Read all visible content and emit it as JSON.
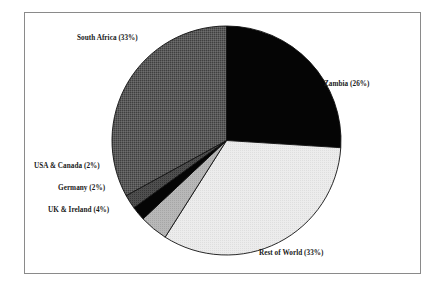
{
  "chart_data": {
    "type": "pie",
    "title": "",
    "subtitle": "",
    "xlabel": "",
    "ylabel": "",
    "legend_position": "none",
    "grid": false,
    "labels_show_percent": true,
    "start_angle_deg": 0,
    "direction": "clockwise",
    "categories": [
      "Zambia",
      "Rest of World",
      "UK & Ireland",
      "Germany",
      "USA & Canada",
      "South Africa"
    ],
    "values": [
      26,
      33,
      4,
      2,
      2,
      33
    ],
    "slices": [
      {
        "name": "Zambia",
        "label": "Zambia (26%)",
        "value": 26,
        "color": "#050505",
        "start_deg": 0,
        "end_deg": 93.6
      },
      {
        "name": "Rest of World",
        "label": "Rest of World (33%)",
        "value": 33,
        "color": "#e6e6e6",
        "start_deg": 93.6,
        "end_deg": 212.4
      },
      {
        "name": "UK & Ireland",
        "label": "UK & Ireland (4%)",
        "value": 4,
        "color": "#b4b4b4",
        "start_deg": 212.4,
        "end_deg": 226.8
      },
      {
        "name": "Germany",
        "label": "Germany (2%)",
        "value": 2,
        "color": "#050505",
        "start_deg": 226.8,
        "end_deg": 234.0
      },
      {
        "name": "USA & Canada",
        "label": "USA & Canada (2%)",
        "value": 2,
        "color": "#4d4d4d",
        "start_deg": 234.0,
        "end_deg": 241.2
      },
      {
        "name": "South Africa",
        "label": "South Africa (33%)",
        "value": 33,
        "color": "#565656",
        "start_deg": 241.2,
        "end_deg": 360.0
      }
    ]
  },
  "frame": {
    "border_color": "#8a8a8a",
    "background": "#ffffff"
  }
}
